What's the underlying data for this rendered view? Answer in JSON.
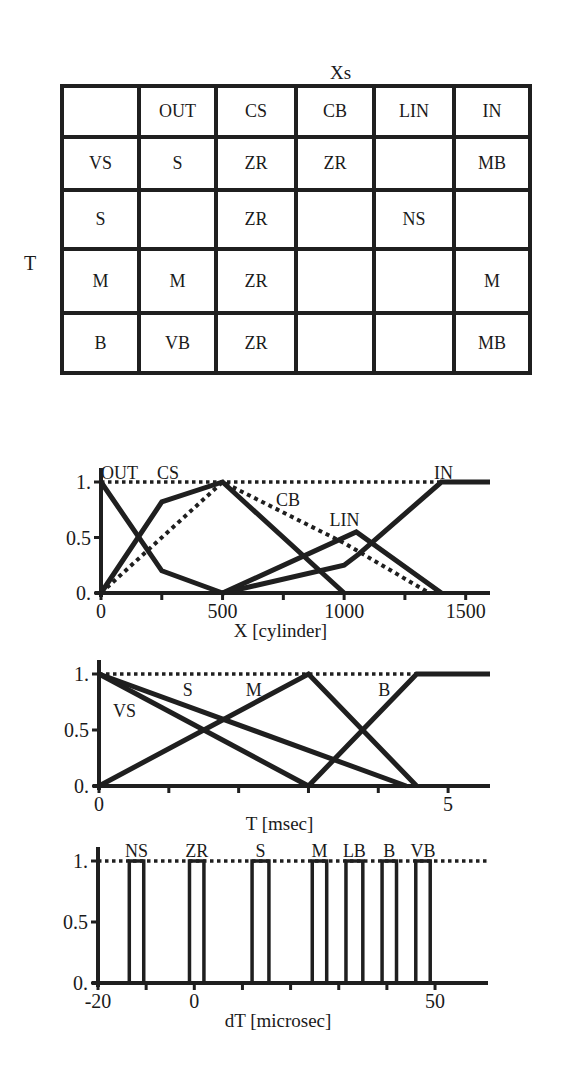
{
  "table": {
    "col_axis_label": "Xs",
    "row_axis_label": "T",
    "headers": [
      "",
      "OUT",
      "CS",
      "CB",
      "LIN",
      "IN"
    ],
    "rows": [
      [
        "VS",
        "S",
        "ZR",
        "ZR",
        "",
        "MB"
      ],
      [
        "S",
        "",
        "ZR",
        "",
        "NS",
        ""
      ],
      [
        "M",
        "M",
        "ZR",
        "",
        "",
        "M"
      ],
      [
        "B",
        "VB",
        "ZR",
        "",
        "",
        "MB"
      ]
    ]
  },
  "chart_data": [
    {
      "type": "line",
      "title": "",
      "xlabel": "X  [cylinder]",
      "ylabel": "",
      "xlim": [
        0,
        1600
      ],
      "ylim": [
        0,
        1
      ],
      "xticks": [
        0,
        250,
        500,
        750,
        1000,
        1250,
        1500
      ],
      "xtick_labels": {
        "0": "0",
        "500": "500",
        "1000": "1000",
        "1500": "1500"
      },
      "yticks": [
        0,
        0.5,
        1
      ],
      "ytick_labels": [
        "0.",
        "0.5",
        "1."
      ],
      "grid": false,
      "reference_line": {
        "y": 1,
        "style": "dotted"
      },
      "series": [
        {
          "name": "OUT",
          "style": "solid",
          "points": [
            [
              0,
              1
            ],
            [
              250,
              0.2
            ],
            [
              500,
              0
            ]
          ],
          "label_pos": [
            0,
            1.03
          ]
        },
        {
          "name": "CS",
          "style": "solid",
          "points": [
            [
              0,
              0
            ],
            [
              250,
              0.82
            ],
            [
              500,
              1
            ],
            [
              1000,
              0
            ]
          ],
          "label_pos": [
            230,
            1.03
          ]
        },
        {
          "name": "CB",
          "style": "dotted",
          "points": [
            [
              0,
              0
            ],
            [
              500,
              1
            ],
            [
              1000,
              0.45
            ],
            [
              1350,
              0
            ]
          ],
          "label_pos": [
            720,
            0.78
          ]
        },
        {
          "name": "LIN",
          "style": "solid",
          "points": [
            [
              500,
              0
            ],
            [
              1050,
              0.55
            ],
            [
              1400,
              0
            ]
          ],
          "label_pos": [
            940,
            0.6
          ]
        },
        {
          "name": "IN",
          "style": "solid",
          "points": [
            [
              500,
              0
            ],
            [
              1000,
              0.25
            ],
            [
              1060,
              0.35
            ],
            [
              1400,
              1
            ],
            [
              1600,
              1
            ]
          ],
          "label_pos": [
            1370,
            1.03
          ]
        }
      ]
    },
    {
      "type": "line",
      "title": "",
      "xlabel": "T  [msec]",
      "ylabel": "",
      "xlim": [
        0,
        5.6
      ],
      "ylim": [
        0,
        1
      ],
      "xticks": [
        0,
        1,
        2,
        3,
        4,
        5
      ],
      "xtick_labels": {
        "0": "0",
        "5": "5"
      },
      "yticks": [
        0,
        0.5,
        1
      ],
      "ytick_labels": [
        "0.",
        "0.5",
        "1."
      ],
      "grid": false,
      "reference_line": {
        "y": 1,
        "style": "dotted"
      },
      "series": [
        {
          "name": "VS",
          "style": "solid",
          "points": [
            [
              0,
              1
            ],
            [
              3,
              0
            ]
          ],
          "label_pos": [
            0.2,
            0.62
          ]
        },
        {
          "name": "S",
          "style": "solid",
          "points": [
            [
              0,
              1
            ],
            [
              4.4,
              0
            ]
          ],
          "label_pos": [
            1.2,
            0.8
          ]
        },
        {
          "name": "M",
          "style": "solid",
          "points": [
            [
              0,
              0
            ],
            [
              3,
              1
            ],
            [
              4.55,
              0
            ]
          ],
          "label_pos": [
            2.1,
            0.8
          ]
        },
        {
          "name": "B",
          "style": "solid",
          "points": [
            [
              3,
              0
            ],
            [
              4.55,
              1
            ],
            [
              5.6,
              1
            ]
          ],
          "label_pos": [
            4.0,
            0.8
          ]
        }
      ]
    },
    {
      "type": "bar",
      "title": "",
      "xlabel": "dT  [microsec]",
      "ylabel": "",
      "xlim": [
        -20,
        64
      ],
      "ylim": [
        0,
        1
      ],
      "xticks": [
        -20,
        -10,
        0,
        10,
        20,
        30,
        40,
        50
      ],
      "xtick_labels": {
        "-20": "-20",
        "0": "0",
        "50": "50"
      },
      "yticks": [
        0,
        0.5,
        1
      ],
      "ytick_labels": [
        "0.",
        "0.5",
        "1."
      ],
      "grid": false,
      "reference_line": {
        "y": 1,
        "style": "dotted"
      },
      "bars": [
        {
          "name": "NS",
          "from": -13.5,
          "to": -10.5,
          "height": 1
        },
        {
          "name": "ZR",
          "from": -1,
          "to": 2,
          "height": 1
        },
        {
          "name": "S",
          "from": 12,
          "to": 15.5,
          "height": 1
        },
        {
          "name": "M",
          "from": 24.5,
          "to": 27.5,
          "height": 1
        },
        {
          "name": "LB",
          "from": 31.5,
          "to": 35,
          "height": 1
        },
        {
          "name": "B",
          "from": 39,
          "to": 42,
          "height": 1
        },
        {
          "name": "VB",
          "from": 46,
          "to": 49,
          "height": 1
        }
      ]
    }
  ],
  "colors": {
    "ink": "#1f1f1f",
    "background": "#ffffff"
  }
}
